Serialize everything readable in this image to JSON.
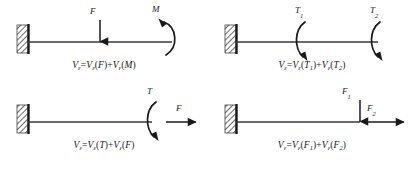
{
  "figure": {
    "type": "engineering-free-body-diagram-grid",
    "background_color": "#ffffff",
    "line_color": "#1a1a1a",
    "rows": 2,
    "columns": 2
  },
  "panels": [
    {
      "id": "panel-1",
      "support": "fixed-wall-hatched",
      "beam": "horizontal-cantilever",
      "loads": [
        {
          "label": "F",
          "symbol_type": "downward-arrow",
          "position": "mid-span"
        },
        {
          "label": "M",
          "symbol_type": "moment-arc-clockwise",
          "position": "free-end"
        }
      ],
      "equation": {
        "lhs_var": "V",
        "lhs_sub": "ε",
        "eq": "=",
        "terms": [
          {
            "var": "V",
            "sub": "ε",
            "arg": "F"
          },
          {
            "var": "V",
            "sub": "ε",
            "arg": "M"
          }
        ],
        "op": "+",
        "text": "Vε=Vε(F)+Vε(M)"
      }
    },
    {
      "id": "panel-2",
      "support": "fixed-wall-hatched",
      "beam": "horizontal-cantilever",
      "loads": [
        {
          "label": "T",
          "sub": "1",
          "symbol_type": "torque-arc",
          "position": "mid-span"
        },
        {
          "label": "T",
          "sub": "2",
          "symbol_type": "torque-arc",
          "position": "free-end"
        }
      ],
      "equation": {
        "lhs_var": "V",
        "lhs_sub": "ε",
        "eq": "=",
        "terms": [
          {
            "var": "V",
            "sub": "ε",
            "arg": "T",
            "arg_sub": "1"
          },
          {
            "var": "V",
            "sub": "ε",
            "arg": "T",
            "arg_sub": "2"
          }
        ],
        "op": "+",
        "text": "Vε=Vε(T1)+Vε(T2)"
      }
    },
    {
      "id": "panel-3",
      "support": "fixed-wall-hatched",
      "beam": "horizontal-cantilever",
      "loads": [
        {
          "label": "T",
          "symbol_type": "torque-arc",
          "position": "free-end"
        },
        {
          "label": "F",
          "symbol_type": "rightward-arrow",
          "position": "beyond-free-end"
        }
      ],
      "equation": {
        "lhs_var": "V",
        "lhs_sub": "ε",
        "eq": "=",
        "terms": [
          {
            "var": "V",
            "sub": "ε",
            "arg": "T"
          },
          {
            "var": "V",
            "sub": "ε",
            "arg": "F"
          }
        ],
        "op": "+",
        "text": "Vε=Vε(T)+Vε(F)"
      }
    },
    {
      "id": "panel-4",
      "support": "fixed-wall-hatched",
      "beam": "horizontal-cantilever",
      "loads": [
        {
          "label": "F",
          "sub": "1",
          "symbol_type": "downward-arrow",
          "position": "free-end"
        },
        {
          "label": "F",
          "sub": "2",
          "symbol_type": "rightward-arrow",
          "position": "beyond-free-end"
        }
      ],
      "equation": {
        "lhs_var": "V",
        "lhs_sub": "ε",
        "eq": "=",
        "terms": [
          {
            "var": "V",
            "sub": "ε",
            "arg": "F",
            "arg_sub": "1"
          },
          {
            "var": "V",
            "sub": "ε",
            "arg": "F",
            "arg_sub": "2"
          }
        ],
        "op": "+",
        "text": "Vε=Vε(F1)+Vε(F2)"
      }
    }
  ],
  "labels": {
    "p1_force_F": "F",
    "p1_moment_M": "M",
    "p2_torque_T1_base": "T",
    "p2_torque_T1_sub": "1",
    "p2_torque_T2_base": "T",
    "p2_torque_T2_sub": "2",
    "p3_torque_T": "T",
    "p3_force_F": "F",
    "p4_force_F1_base": "F",
    "p4_force_F1_sub": "1",
    "p4_force_F2_base": "F",
    "p4_force_F2_sub": "2"
  },
  "equation_parts": {
    "V": "V",
    "eps": "ε",
    "equals": "=",
    "plus": "+",
    "lparen": "(",
    "rparen": ")",
    "F": "F",
    "M": "M",
    "T": "T",
    "one": "1",
    "two": "2"
  }
}
